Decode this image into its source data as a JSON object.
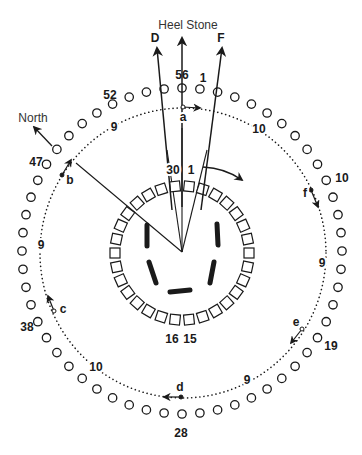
{
  "diagram": {
    "center": {
      "x": 182,
      "y": 252
    },
    "outer_ring": {
      "name": "Aubrey Holes",
      "count": 56,
      "rx": 160,
      "ry": 163,
      "cx": 182,
      "cy": 251,
      "hole_radius": 4.2,
      "labels": [
        {
          "n": "56",
          "x": 182,
          "y": 79
        },
        {
          "n": "1",
          "x": 203,
          "y": 82
        },
        {
          "n": "52",
          "x": 110,
          "y": 99
        },
        {
          "n": "47",
          "x": 36,
          "y": 166
        },
        {
          "n": "10",
          "x": 342,
          "y": 182
        },
        {
          "n": "19",
          "x": 331,
          "y": 350
        },
        {
          "n": "38",
          "x": 27,
          "y": 331
        },
        {
          "n": "28",
          "x": 181,
          "y": 437
        }
      ]
    },
    "dotted_ring": {
      "cx": 183,
      "cy": 253,
      "rx": 143,
      "ry": 145,
      "labels": [
        {
          "text": "9",
          "x": 114,
          "y": 131
        },
        {
          "text": "10",
          "x": 259,
          "y": 133
        },
        {
          "text": "9",
          "x": 322,
          "y": 267
        },
        {
          "text": "9",
          "x": 247,
          "y": 384
        },
        {
          "text": "10",
          "x": 96,
          "y": 371
        },
        {
          "text": "9",
          "x": 41,
          "y": 249
        }
      ]
    },
    "sarsen_ring": {
      "count": 30,
      "cx": 182,
      "cy": 253,
      "r": 67,
      "size": 10,
      "labels": [
        {
          "n": "30",
          "x": 173,
          "y": 174
        },
        {
          "n": "1",
          "x": 191,
          "y": 174
        },
        {
          "n": "16",
          "x": 172,
          "y": 343
        },
        {
          "n": "15",
          "x": 190,
          "y": 343
        }
      ]
    },
    "station_markers": [
      {
        "letter": "a",
        "x": 183,
        "y": 107,
        "lx": 183,
        "ly": 121,
        "ax": 200,
        "ay": 108
      },
      {
        "letter": "b",
        "x": 62,
        "y": 175,
        "lx": 70,
        "ly": 184,
        "ax": 71,
        "ay": 160
      },
      {
        "letter": "c",
        "x": 54,
        "y": 311,
        "lx": 63,
        "ly": 313,
        "ax": 48,
        "ay": 296
      },
      {
        "letter": "d",
        "x": 181,
        "y": 397,
        "lx": 180,
        "ly": 391,
        "ax": 164,
        "ay": 397
      },
      {
        "letter": "e",
        "x": 302,
        "y": 329,
        "lx": 296,
        "ly": 326,
        "ax": 291,
        "ay": 343
      },
      {
        "letter": "f",
        "x": 311,
        "y": 190,
        "lx": 305,
        "ly": 197,
        "ax": 318,
        "ay": 207
      }
    ],
    "sightlines": [
      {
        "label": "D",
        "x1": 172,
        "y1": 210,
        "x2": 157,
        "y2": 48,
        "lx": 155,
        "ly": 42
      },
      {
        "label": "Heel Stone",
        "x1": 182,
        "y1": 207,
        "x2": 182,
        "y2": 38,
        "lx": 188,
        "ly": 29
      },
      {
        "label": "F",
        "x1": 201,
        "y1": 210,
        "x2": 222,
        "y2": 48,
        "lx": 221,
        "ly": 42
      },
      {
        "label": "North",
        "x1": 52,
        "y1": 146,
        "x2": 34,
        "y2": 127,
        "lx": 33,
        "ly": 122
      }
    ],
    "center_lines": [
      {
        "x1": 182,
        "y1": 252,
        "x2": 167,
        "y2": 150
      },
      {
        "x1": 182,
        "y1": 252,
        "x2": 182,
        "y2": 128
      },
      {
        "x1": 182,
        "y1": 252,
        "x2": 207,
        "y2": 150
      },
      {
        "x1": 182,
        "y1": 252,
        "x2": 76,
        "y2": 163
      }
    ],
    "rotation_arrow": {
      "path": "M 203 167 Q 225 168 242 180",
      "ax": 242,
      "ay": 180
    },
    "bluestones": [
      {
        "x1": 147,
        "y1": 225,
        "x2": 147,
        "y2": 246
      },
      {
        "x1": 217,
        "y1": 224,
        "x2": 218,
        "y2": 245
      },
      {
        "x1": 149,
        "y1": 262,
        "x2": 156,
        "y2": 283
      },
      {
        "x1": 214,
        "y1": 262,
        "x2": 210,
        "y2": 283
      },
      {
        "x1": 170,
        "y1": 292,
        "x2": 190,
        "y2": 290
      }
    ],
    "colors": {
      "ink": "#1a1a1a",
      "paper": "#ffffff"
    }
  }
}
